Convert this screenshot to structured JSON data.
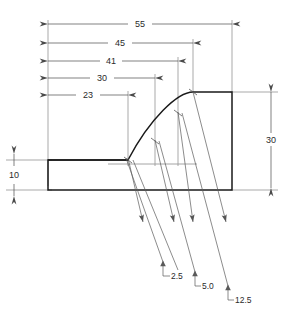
{
  "drawing": {
    "title": "Airfoil / fillet profile section dimensioned drawing",
    "background_color": "#ffffff",
    "outline_color": "#1a1a1a",
    "dimension_color": "#4a4a4a",
    "text_color": "#2b2b2b",
    "units": "mm"
  },
  "horizontal_dimensions": [
    {
      "label": "55",
      "value": 55,
      "x_start": 48,
      "x_end": 232,
      "y": 24
    },
    {
      "label": "45",
      "value": 45,
      "x_start": 48,
      "x_end": 193,
      "y": 43
    },
    {
      "label": "41",
      "value": 41,
      "x_start": 48,
      "x_end": 178,
      "y": 61
    },
    {
      "label": "30",
      "value": 30,
      "x_start": 48,
      "x_end": 155,
      "y": 78
    },
    {
      "label": "23",
      "value": 23,
      "x_start": 48,
      "x_end": 128,
      "y": 95
    }
  ],
  "vertical_dimensions": [
    {
      "label": "30",
      "value": 30,
      "y_start": 92,
      "y_end": 188,
      "x": 271
    },
    {
      "label": "10",
      "value": 10,
      "y_start": 160,
      "y_end": 190,
      "x": 14
    }
  ],
  "leader_labels": [
    {
      "label": "2.5",
      "value": 2.5,
      "x": 168,
      "y": 269
    },
    {
      "label": "5.0",
      "value": 5.0,
      "x": 199,
      "y": 280
    },
    {
      "label": "12.5",
      "value": 12.5,
      "x": 232,
      "y": 295
    }
  ],
  "profile": {
    "base_left_x": 48,
    "base_bottom_y": 190,
    "base_top_y": 160,
    "curve_start_x": 128,
    "curve_start_y": 160,
    "curve_end_x": 193,
    "curve_end_y": 92,
    "top_flat_end_x": 232,
    "right_edge_x": 232
  },
  "station_lines": [
    {
      "x": 128,
      "curve_y": 160
    },
    {
      "x": 155,
      "curve_y": 141
    },
    {
      "x": 178,
      "curve_y": 113
    },
    {
      "x": 193,
      "curve_y": 92
    }
  ]
}
